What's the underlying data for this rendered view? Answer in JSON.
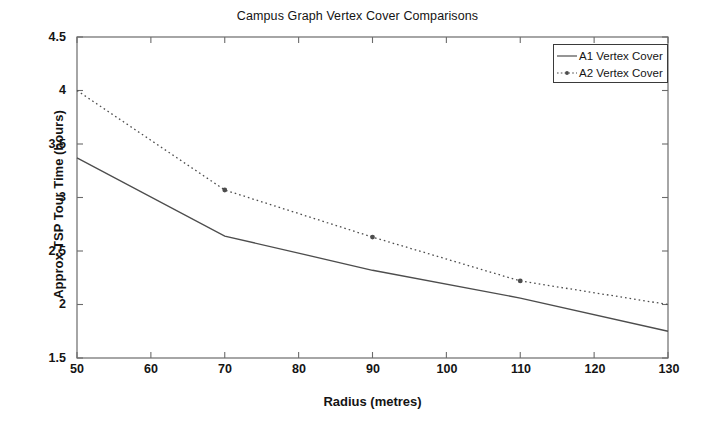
{
  "chart_data": {
    "type": "line",
    "title": "Campus Graph Vertex Cover Comparisons",
    "xlabel": "Radius (metres)",
    "ylabel": "Approx-TSP Tour Time (hours)",
    "xlim": [
      50,
      130
    ],
    "ylim": [
      1.5,
      4.5
    ],
    "xticks": [
      50,
      60,
      70,
      80,
      90,
      100,
      110,
      120,
      130
    ],
    "xtick_labels": [
      "50",
      "60",
      "70",
      "80",
      "90",
      "100",
      "110",
      "120",
      "130"
    ],
    "yticks": [
      1.5,
      2,
      2.5,
      3,
      3.5,
      4,
      4.5
    ],
    "ytick_labels": [
      "1.5",
      "2",
      "2.5",
      "3",
      "3.5",
      "4",
      "4.5"
    ],
    "grid": false,
    "legend_position": "top-right",
    "x": [
      50,
      70,
      90,
      110,
      130
    ],
    "series": [
      {
        "name": "A1 Vertex Cover",
        "values": [
          3.37,
          2.64,
          2.32,
          2.06,
          1.75
        ],
        "style": "solid",
        "marker": "none",
        "color": "#4d4d4d"
      },
      {
        "name": "A2 Vertex Cover",
        "values": [
          4.0,
          3.07,
          2.63,
          2.22,
          2.0
        ],
        "style": "dotted",
        "marker": "dot",
        "color": "#4d4d4d"
      }
    ]
  },
  "legend": {
    "entries": [
      {
        "label": "A1 Vertex Cover",
        "sample": "solid-line-sample"
      },
      {
        "label": "A2 Vertex Cover",
        "sample": "dotted-line-dot-sample"
      }
    ]
  },
  "axes": {
    "title": "Campus Graph Vertex Cover Comparisons",
    "xlabel": "Radius (metres)",
    "ylabel": "Approx-TSP Tour Time (hours)",
    "ytick_labels": [
      "4.5",
      "4",
      "3.5",
      "3",
      "2.5",
      "2",
      "1.5"
    ],
    "xtick_labels": [
      "50",
      "60",
      "70",
      "80",
      "90",
      "100",
      "110",
      "120",
      "130"
    ]
  },
  "colors": {
    "axis": "#6b6b6b",
    "line": "#4d4d4d",
    "text": "#141414",
    "background": "#ffffff"
  }
}
